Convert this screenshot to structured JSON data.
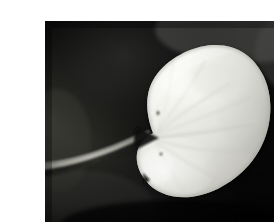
{
  "image": {
    "title": "Black and white photograph of a heart-shaped leaf",
    "subject": "leaf",
    "medium": "grayscale-photograph",
    "orientation": "landscape",
    "frame": {
      "page_background_color": "#ffffff",
      "photo_left": 5,
      "photo_top": 5,
      "photo_width": 265,
      "photo_height": 212
    },
    "palette": {
      "background_darkest": "#040404",
      "background_dark": "#121212",
      "background_mid": "#2e2e2e",
      "background_light": "#4a4a4a",
      "background_upper_right_glow": "#6a6a6a",
      "leaf_highlight": "#fdfdfb",
      "leaf_base": "#efefea",
      "leaf_shadow": "#c9c9c2",
      "leaf_vein": "#d8d8d2",
      "leaf_edge_shadow": "#a9a9a2",
      "stem_light": "#b4b4ae",
      "stem_dark": "#5c5c58",
      "speck_color": "#3c3c3a"
    },
    "content": {
      "leaf": {
        "shape": "cordate-reniform",
        "lobes": 2,
        "sinus_position_x": 113,
        "sinus_position_y": 117,
        "notch_position_x": 103,
        "notch_position_y": 157,
        "bounds": {
          "x": 80,
          "y": 28,
          "width": 140,
          "height": 152
        }
      },
      "stem": {
        "description": "thin curved petiole entering from left edge",
        "start_x": 0,
        "start_y": 142,
        "end_x": 113,
        "end_y": 117
      },
      "veins": {
        "midrib": "horizontal from sinus to right margin",
        "secondary_count": 7
      },
      "specks": [
        {
          "x": 113,
          "y": 92,
          "r": 1.4
        },
        {
          "x": 116,
          "y": 133,
          "r": 1.3
        }
      ]
    }
  }
}
